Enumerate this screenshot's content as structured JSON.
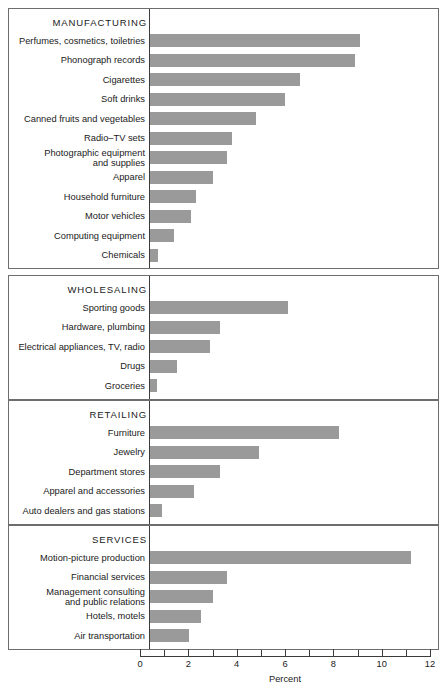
{
  "chart_data": {
    "type": "bar",
    "orientation": "horizontal",
    "title": "",
    "xlabel": "Percent",
    "ylabel": "",
    "xlim": [
      0,
      12
    ],
    "xticks": [
      0,
      1,
      2,
      3,
      4,
      5,
      6,
      7,
      8,
      9,
      10,
      11,
      12
    ],
    "xtick_labels": [
      "0",
      "",
      "2",
      "",
      "4",
      "",
      "6",
      "",
      "8",
      "",
      "10",
      "",
      "12"
    ],
    "grid": false,
    "legend": false,
    "bar_color": "#9a9a9a",
    "panels": [
      {
        "name": "MANUFACTURING",
        "categories": [
          "Perfumes, cosmetics, toiletries",
          "Phonograph records",
          "Cigarettes",
          "Soft drinks",
          "Canned fruits and vegetables",
          "Radio–TV sets",
          "Photographic equipment\nand supplies",
          "Apparel",
          "Household furniture",
          "Motor vehicles",
          "Computing equipment",
          "Chemicals"
        ],
        "values": [
          8.7,
          8.5,
          6.2,
          5.6,
          4.4,
          3.4,
          3.2,
          2.6,
          1.9,
          1.7,
          1.0,
          0.35
        ]
      },
      {
        "name": "WHOLESALING",
        "categories": [
          "Sporting goods",
          "Hardware, plumbing",
          "Electrical appliances, TV, radio",
          "Drugs",
          "Groceries"
        ],
        "values": [
          5.7,
          2.9,
          2.5,
          1.1,
          0.3
        ]
      },
      {
        "name": "RETAILING",
        "categories": [
          "Furniture",
          "Jewelry",
          "Department stores",
          "Apparel and accessories",
          "Auto dealers and gas stations"
        ],
        "values": [
          7.8,
          4.5,
          2.9,
          1.8,
          0.5
        ]
      },
      {
        "name": "SERVICES",
        "categories": [
          "Motion-picture production",
          "Financial services",
          "Management consulting\nand public relations",
          "Hotels, motels",
          "Air transportation"
        ],
        "values": [
          10.8,
          3.2,
          2.6,
          2.1,
          1.6
        ]
      }
    ]
  },
  "axis": {
    "title": "Percent"
  }
}
